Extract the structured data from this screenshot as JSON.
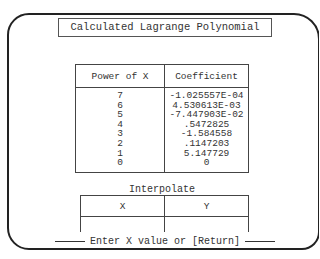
{
  "title": "Calculated Lagrange Polynomial",
  "coefficient_table": {
    "headers": [
      "Power of X",
      "Coefficient"
    ],
    "rows": [
      {
        "power": "7",
        "coefficient": "-1.025557E-04"
      },
      {
        "power": "6",
        "coefficient": "4.530613E-03"
      },
      {
        "power": "5",
        "coefficient": "-7.447903E-02"
      },
      {
        "power": "4",
        "coefficient": ".5472825"
      },
      {
        "power": "3",
        "coefficient": "-1.584558"
      },
      {
        "power": "2",
        "coefficient": ".1147203"
      },
      {
        "power": "1",
        "coefficient": "5.147729"
      },
      {
        "power": "0",
        "coefficient": "0"
      }
    ]
  },
  "interpolate": {
    "title": "Interpolate",
    "headers": [
      "X",
      "Y"
    ],
    "x_value": "",
    "y_value": ""
  },
  "prompt": "Enter X value or [Return]"
}
